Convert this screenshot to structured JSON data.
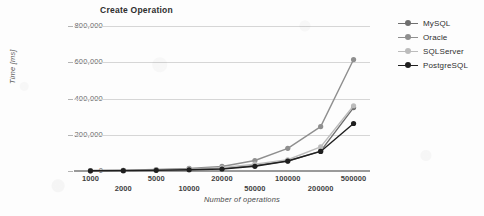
{
  "chart_data": {
    "type": "line",
    "title": "Create Operation",
    "xlabel": "Number of operations",
    "ylabel": "Time [ms]",
    "categories": [
      "1000",
      "2000",
      "5000",
      "10000",
      "20000",
      "50000",
      "100000",
      "200000",
      "500000"
    ],
    "ytick_labels": [
      "800,000",
      "600,000",
      "400,000",
      "200,000",
      "0"
    ],
    "ytick_values": [
      800000,
      600000,
      400000,
      200000,
      0
    ],
    "ylim": [
      0,
      800000
    ],
    "grid": "horizontal",
    "legend_position": "right",
    "series": [
      {
        "name": "MySQL",
        "color": "#6f6f6f",
        "values": [
          1500,
          2500,
          5000,
          8000,
          14000,
          30000,
          55000,
          110000,
          350000
        ]
      },
      {
        "name": "Oracle",
        "color": "#8f8f8f",
        "values": [
          2500,
          4000,
          8000,
          14000,
          25000,
          58000,
          125000,
          245000,
          615000
        ]
      },
      {
        "name": "SQLServer",
        "color": "#bcbcbc",
        "values": [
          2000,
          3000,
          6000,
          10000,
          18000,
          38000,
          62000,
          133000,
          360000
        ]
      },
      {
        "name": "PostgreSQL",
        "color": "#1f1f1f",
        "values": [
          1200,
          2000,
          4000,
          7000,
          11000,
          26000,
          55000,
          108000,
          262000
        ]
      }
    ]
  }
}
